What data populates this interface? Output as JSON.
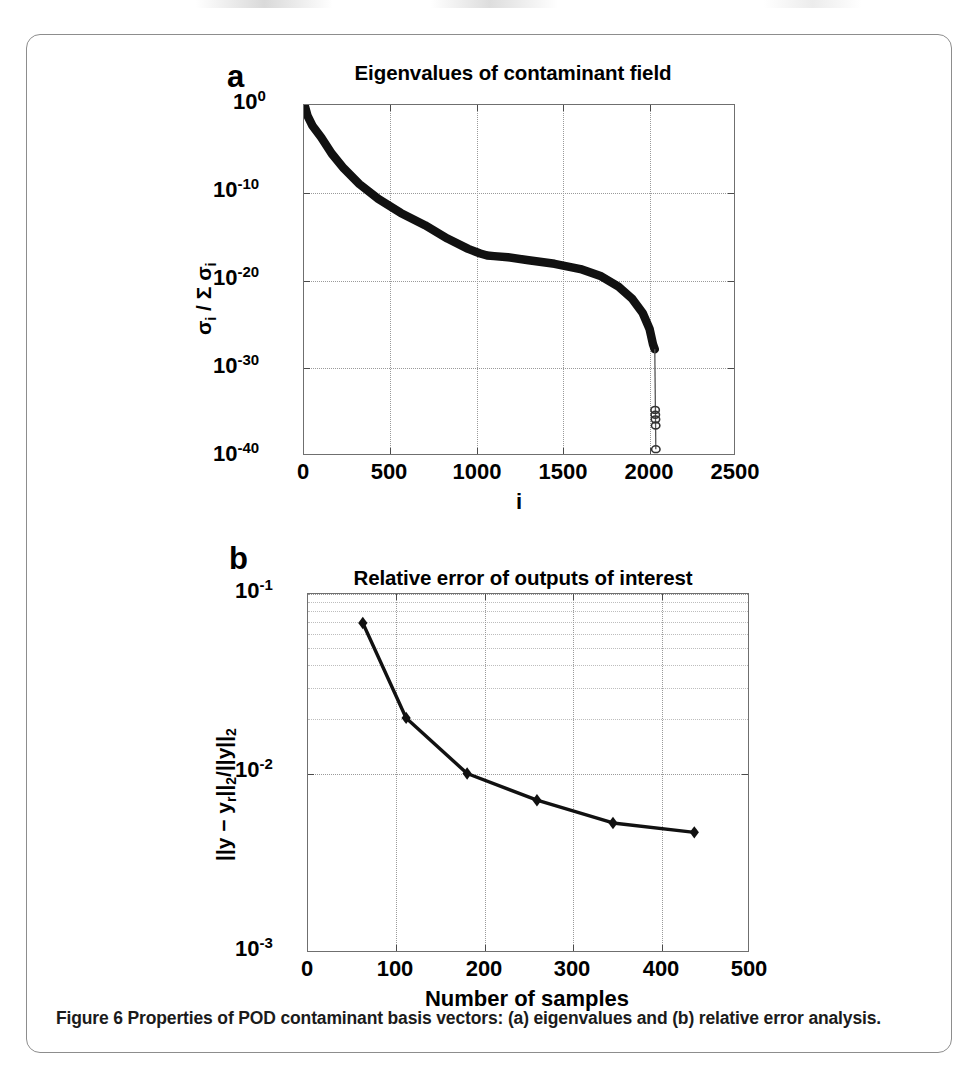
{
  "figure": {
    "caption_prefix": "Figure 6 Properties of POD contaminant basis vectors: ",
    "caption_a_tag": "(a)",
    "caption_mid": " eigenvalues and ",
    "caption_b_tag": "(b)",
    "caption_suffix": " relative error analysis.",
    "border_color": "#8d8d8d"
  },
  "panel_a": {
    "letter": "a",
    "title": "Eigenvalues of contaminant field",
    "xlabel": "i",
    "ylabel": "σi / Σ σi",
    "xticks": [
      "0",
      "500",
      "1000",
      "1500",
      "2000",
      "2500"
    ],
    "yticks": [
      "10",
      "10",
      "10",
      "10",
      "10"
    ],
    "yexps": [
      "0",
      "-10",
      "-20",
      "-30",
      "-40"
    ]
  },
  "panel_b": {
    "letter": "b",
    "title": "Relative error of outputs of interest",
    "xlabel": "Number of samples",
    "ylabel": "||y − yr||2/||y||2",
    "xticks": [
      "0",
      "100",
      "200",
      "300",
      "400",
      "500"
    ],
    "yticks": [
      "10",
      "10",
      "10"
    ],
    "yexps": [
      "-1",
      "-2",
      "-3"
    ]
  },
  "chart_data": [
    {
      "type": "line",
      "panel": "a",
      "title": "Eigenvalues of contaminant field",
      "xlabel": "i",
      "ylabel": "sigma_i / sum sigma_i",
      "xlim": [
        0,
        2500
      ],
      "ylim": [
        1e-40,
        1
      ],
      "yscale": "log",
      "grid": true,
      "legend": null,
      "marker": "circle",
      "series": [
        {
          "name": "normalized eigenvalue spectrum",
          "x": [
            5,
            20,
            50,
            100,
            160,
            230,
            320,
            430,
            560,
            700,
            830,
            950,
            1020,
            1060,
            1100,
            1180,
            1300,
            1450,
            1600,
            1720,
            1820,
            1900,
            1960,
            2000,
            2020,
            2030
          ],
          "y": [
            0.75,
            0.06,
            0.004,
            0.0002,
            3e-06,
            6e-08,
            1e-09,
            2e-11,
            5e-13,
            2e-14,
            6e-16,
            4e-17,
            1.2e-17,
            7e-18,
            6e-18,
            4.5e-18,
            2e-18,
            8e-19,
            2e-19,
            3e-20,
            2e-21,
            8e-23,
            2e-24,
            3e-26,
            5e-28,
            1.5e-28
          ]
        },
        {
          "name": "trailing near-zero eigenvalues",
          "x": [
            2032,
            2033,
            2034,
            2035,
            2036
          ],
          "y": [
            1.8e-35,
            5e-36,
            1.5e-36,
            3e-37,
            6e-40
          ]
        }
      ]
    },
    {
      "type": "line",
      "panel": "b",
      "title": "Relative error of outputs of interest",
      "xlabel": "Number of samples",
      "ylabel": "||y - y_r||_2 / ||y||_2",
      "xlim": [
        0,
        500
      ],
      "ylim": [
        0.001,
        0.1
      ],
      "yscale": "log",
      "grid": true,
      "legend": null,
      "marker": "diamond",
      "x": [
        62,
        111,
        180,
        259,
        345,
        437
      ],
      "values": [
        0.069,
        0.0204,
        0.01,
        0.0071,
        0.0053,
        0.0047
      ]
    }
  ]
}
